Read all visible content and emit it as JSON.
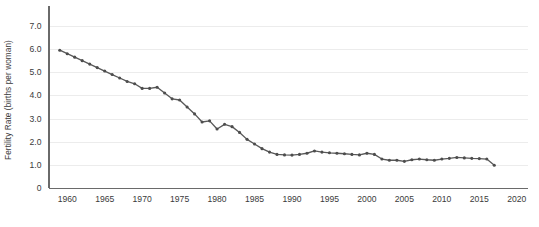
{
  "chart_data": {
    "type": "line",
    "title": "",
    "subtitle": "",
    "xlabel": "",
    "ylabel": "Fertility Rate (births per woman)",
    "xlim": [
      1957.5,
      2021.5
    ],
    "ylim": [
      0,
      7.6
    ],
    "grid": true,
    "grid_axis": "y",
    "legend": false,
    "legend_position": "none",
    "marker": "circle",
    "line_color": "#595959",
    "marker_color": "#4d4d4d",
    "grid_color": "#ececec",
    "axis_color": "#6a6a6a",
    "background_color": "#ffffff",
    "xticks": [
      1960,
      1965,
      1970,
      1975,
      1980,
      1985,
      1990,
      1995,
      2000,
      2005,
      2010,
      2015,
      2020
    ],
    "xticklabels": [
      "1960",
      "1965",
      "1970",
      "1975",
      "1980",
      "1985",
      "1990",
      "1995",
      "2000",
      "2005",
      "2010",
      "2015",
      "2020"
    ],
    "yticks": [
      0,
      1.0,
      2.0,
      3.0,
      4.0,
      5.0,
      6.0,
      7.0
    ],
    "yticklabels": [
      "0",
      "1.0",
      "2.0",
      "3.0",
      "4.0",
      "5.0",
      "6.0",
      "7.0"
    ],
    "x": [
      1959,
      1960,
      1961,
      1962,
      1963,
      1964,
      1965,
      1966,
      1967,
      1968,
      1969,
      1970,
      1971,
      1972,
      1973,
      1974,
      1975,
      1976,
      1977,
      1978,
      1979,
      1980,
      1981,
      1982,
      1983,
      1984,
      1985,
      1986,
      1987,
      1988,
      1989,
      1990,
      1991,
      1992,
      1993,
      1994,
      1995,
      1996,
      1997,
      1998,
      1999,
      2000,
      2001,
      2002,
      2003,
      2004,
      2005,
      2006,
      2007,
      2008,
      2009,
      2010,
      2011,
      2012,
      2013,
      2014,
      2015,
      2016,
      2017
    ],
    "y": [
      5.95,
      5.8,
      5.65,
      5.5,
      5.35,
      5.2,
      5.05,
      4.9,
      4.75,
      4.6,
      4.5,
      4.3,
      4.3,
      4.35,
      4.1,
      3.85,
      3.8,
      3.5,
      3.2,
      2.85,
      2.9,
      2.55,
      2.75,
      2.65,
      2.4,
      2.1,
      1.9,
      1.7,
      1.55,
      1.45,
      1.43,
      1.42,
      1.45,
      1.5,
      1.6,
      1.55,
      1.52,
      1.5,
      1.48,
      1.45,
      1.43,
      1.5,
      1.45,
      1.25,
      1.2,
      1.2,
      1.15,
      1.22,
      1.25,
      1.22,
      1.2,
      1.25,
      1.28,
      1.32,
      1.3,
      1.28,
      1.27,
      1.25,
      0.98
    ]
  }
}
